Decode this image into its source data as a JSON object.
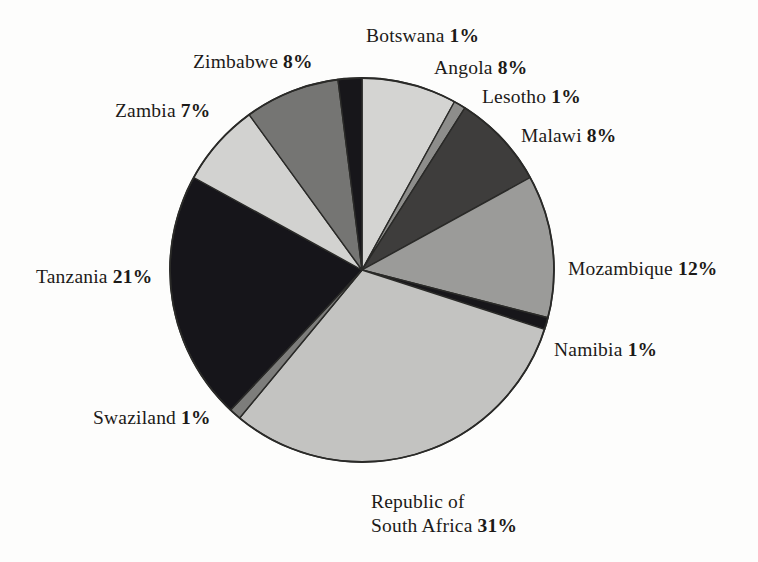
{
  "chart_data": {
    "type": "pie",
    "title": "",
    "subtitle": "",
    "xlabel": "",
    "ylabel": "",
    "legend_position": "none",
    "grid": false,
    "start_angle_deg": 0,
    "direction": "clockwise",
    "categories": [
      "Angola",
      "Lesotho",
      "Malawi",
      "Mozambique",
      "Namibia",
      "Republic of South Africa",
      "Swaziland",
      "Tanzania",
      "Zambia",
      "Zimbabwe",
      "Botswana"
    ],
    "values": [
      8,
      1,
      8,
      12,
      1,
      31,
      1,
      21,
      7,
      8,
      1
    ],
    "units": "%",
    "slices": [
      {
        "name": "Angola",
        "value": 8,
        "label": "Angola",
        "pct": "8%",
        "color": "#d4d4d2",
        "start_deg": 0.0,
        "end_deg": 28.8
      },
      {
        "name": "Lesotho",
        "value": 1,
        "label": "Lesotho",
        "pct": "1%",
        "color": "#8d8d8b",
        "start_deg": 28.8,
        "end_deg": 32.4
      },
      {
        "name": "Malawi",
        "value": 8,
        "label": "Malawi",
        "pct": "8%",
        "color": "#3e3d3c",
        "start_deg": 32.4,
        "end_deg": 61.2
      },
      {
        "name": "Mozambique",
        "value": 12,
        "label": "Mozambique",
        "pct": "12%",
        "color": "#9b9b99",
        "start_deg": 61.2,
        "end_deg": 104.4
      },
      {
        "name": "Namibia",
        "value": 1,
        "label": "Namibia",
        "pct": "1%",
        "color": "#17161a",
        "start_deg": 104.4,
        "end_deg": 108.0
      },
      {
        "name": "Republic of South Africa",
        "value": 31,
        "label_line1": "Republic of",
        "label_line2": "South Africa",
        "pct": "31%",
        "color": "#c3c3c1",
        "start_deg": 108.0,
        "end_deg": 219.6
      },
      {
        "name": "Swaziland",
        "value": 1,
        "label": "Swaziland",
        "pct": "1%",
        "color": "#7d7d7b",
        "start_deg": 219.6,
        "end_deg": 223.2
      },
      {
        "name": "Tanzania",
        "value": 21,
        "label": "Tanzania",
        "pct": "21%",
        "color": "#16151a",
        "start_deg": 223.2,
        "end_deg": 298.8
      },
      {
        "name": "Zambia",
        "value": 7,
        "label": "Zambia",
        "pct": "7%",
        "color": "#d2d2d0",
        "start_deg": 298.8,
        "end_deg": 324.0
      },
      {
        "name": "Zimbabwe",
        "value": 8,
        "label": "Zimbabwe",
        "pct": "8%",
        "color": "#757573",
        "start_deg": 324.0,
        "end_deg": 352.8
      },
      {
        "name": "Botswana",
        "value": 1,
        "label": "Botswana",
        "pct": "1%",
        "color": "#17161a",
        "start_deg": 352.8,
        "end_deg": 360.0
      }
    ],
    "geometry": {
      "cx": 362,
      "cy": 270,
      "r": 192
    },
    "colors": {
      "background": "#fdfdfc",
      "outline": "#2a2a28",
      "text": "#1c1a18"
    }
  }
}
